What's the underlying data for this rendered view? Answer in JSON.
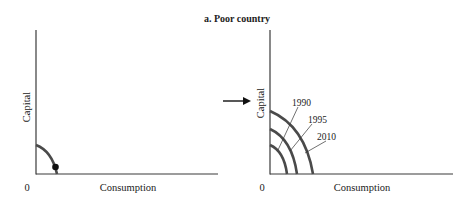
{
  "title": "a. Poor country",
  "panels": [
    {
      "id": "left",
      "y_label": "Capital",
      "x_label": "Consumption",
      "origin_label": "0"
    },
    {
      "id": "right",
      "y_label": "Capital",
      "x_label": "Consumption",
      "origin_label": "0",
      "curve_labels": [
        "1990",
        "1995",
        "2010"
      ]
    }
  ],
  "colors": {
    "axis": "#3a3a3a",
    "curve": "#4a4a4a",
    "text": "#222222"
  }
}
